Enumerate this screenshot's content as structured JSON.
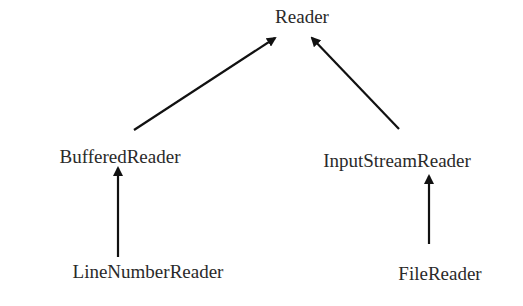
{
  "diagram": {
    "nodes": [
      {
        "id": "reader",
        "label": "Reader",
        "x": 302,
        "y": 7
      },
      {
        "id": "buffered",
        "label": "BufferedReader",
        "x": 120,
        "y": 147
      },
      {
        "id": "inputstream",
        "label": "InputStreamReader",
        "x": 397,
        "y": 151
      },
      {
        "id": "linenumber",
        "label": "LineNumberReader",
        "x": 148,
        "y": 262
      },
      {
        "id": "file",
        "label": "FileReader",
        "x": 440,
        "y": 264
      }
    ],
    "edges": [
      {
        "from": "BufferedReader",
        "to": "Reader"
      },
      {
        "from": "InputStreamReader",
        "to": "Reader"
      },
      {
        "from": "LineNumberReader",
        "to": "BufferedReader"
      },
      {
        "from": "FileReader",
        "to": "InputStreamReader"
      }
    ],
    "colors": {
      "text": "#2a2a2a",
      "arrow": "#111111",
      "background": "#ffffff"
    }
  }
}
